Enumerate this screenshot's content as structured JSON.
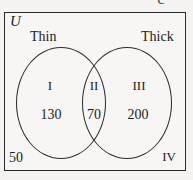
{
  "figure": {
    "type": "venn-diagram-two-set",
    "universe_label": "U",
    "clipped_glyph": "c",
    "background_color": "#f4f3f1",
    "box_color": "#f7f6f4",
    "line_color": "#2a2a2a"
  },
  "sets": {
    "left": {
      "title": "Thin"
    },
    "right": {
      "title": "Thick"
    }
  },
  "regions": [
    {
      "numeral": "I",
      "count": "130",
      "meaning": "thin-only"
    },
    {
      "numeral": "II",
      "count": "70",
      "meaning": "thin-and-thick"
    },
    {
      "numeral": "III",
      "count": "200",
      "meaning": "thick-only"
    },
    {
      "numeral": "IV",
      "count": "50",
      "meaning": "neither"
    }
  ],
  "chart_data": {
    "type": "venn",
    "title": "",
    "universe_label": "U",
    "set_labels": [
      "Thin",
      "Thick"
    ],
    "region_labels": [
      "I",
      "II",
      "III",
      "IV"
    ],
    "region_values": [
      130,
      70,
      200,
      50
    ],
    "regions": [
      {
        "id": "I",
        "sets": [
          "Thin"
        ],
        "value": 130
      },
      {
        "id": "II",
        "sets": [
          "Thin",
          "Thick"
        ],
        "value": 70
      },
      {
        "id": "III",
        "sets": [
          "Thick"
        ],
        "value": 200
      },
      {
        "id": "IV",
        "sets": [],
        "value": 50
      }
    ],
    "total": 450,
    "grid": false,
    "legend": "none"
  }
}
